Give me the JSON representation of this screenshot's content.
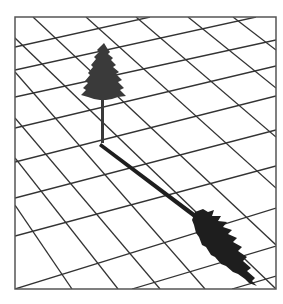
{
  "figure": {
    "frame_color": "#555555",
    "grid_color": "#333333",
    "tree_color": "#3a3a3a",
    "shadow_color": "#1e1e1e",
    "background": "#ffffff"
  }
}
